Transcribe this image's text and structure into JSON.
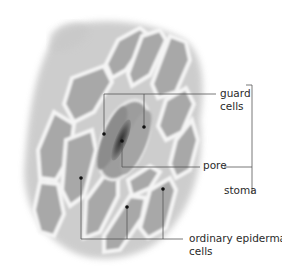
{
  "diagram": {
    "labels": {
      "guard_cells": [
        "guard",
        "cells"
      ],
      "pore": "pore",
      "stoma": "stoma",
      "ordinary_epidermal_cells": [
        "ordinary epidermal",
        "cells"
      ]
    },
    "colors": {
      "leader_line": "#555555",
      "text": "#2a2a2a",
      "cell_wall": "#f2f2f2",
      "cell_fill": "#a9a9a9",
      "pore_dark": "#3b3b3b"
    }
  }
}
